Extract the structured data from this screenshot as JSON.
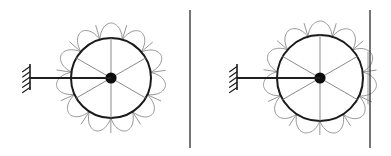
{
  "figure": {
    "background_color": "#ffffff",
    "width": 391,
    "height": 156
  },
  "colors": {
    "rim_stroke": "#1a1a1a",
    "lobe_stroke": "#8a8a8a",
    "spoke_stroke": "#7d7d7d",
    "hub_fill": "#0d0d0d",
    "arm_stroke": "#1f1f1f",
    "wall_stroke": "#2b2b2b",
    "background": "#ffffff"
  },
  "panels": [
    {
      "id": "left-panel",
      "name": "free-wheel-panel",
      "label": "Wheel clear of wall",
      "contact": false,
      "wheel": {
        "center_x": 111,
        "center_y": 78,
        "rim_radius": 40,
        "lobe_inner_radius": 40,
        "lobe_outer_radius": 55,
        "lobe_count": 11,
        "spoke_count": 6,
        "hub_radius": 5.6,
        "spoke_angles_deg": [
          90,
          150,
          210,
          270,
          330,
          30
        ]
      },
      "axle_arm": {
        "x_start": 30,
        "x_end": 111,
        "y": 78
      },
      "support": {
        "x": 30,
        "y_top": 64,
        "y_bottom": 90,
        "hatch_count": 5,
        "hatch_length": 9,
        "hatch_angle_deg": 35
      },
      "wall": {
        "x": 190,
        "y_top": 10,
        "y_bottom": 148
      }
    },
    {
      "id": "right-panel",
      "name": "wheel-in-contact-panel",
      "label": "Wheel pressed against wall",
      "contact": true,
      "wheel": {
        "center_x": 320,
        "center_y": 78,
        "rim_radius": 43,
        "lobe_inner_radius": 43,
        "lobe_outer_radius": 57,
        "lobe_count": 11,
        "spoke_count": 6,
        "hub_radius": 5.6,
        "spoke_angles_deg": [
          90,
          150,
          210,
          270,
          330,
          30
        ]
      },
      "axle_arm": {
        "x_start": 237,
        "x_end": 320,
        "y": 78
      },
      "support": {
        "x": 237,
        "y_top": 64,
        "y_bottom": 90,
        "hatch_count": 5,
        "hatch_length": 9,
        "hatch_angle_deg": 35
      },
      "wall": {
        "x": 370,
        "y_top": 10,
        "y_bottom": 148
      },
      "contact_flat": {
        "x": 368,
        "y_top": 52,
        "y_bottom": 104
      }
    }
  ]
}
